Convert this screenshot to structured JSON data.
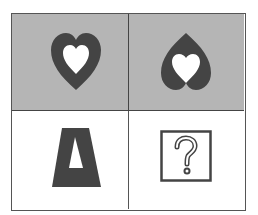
{
  "puzzle": {
    "cells": [
      {
        "position": "top-left",
        "shape": "heart",
        "orientation": "upright",
        "inner": "white-heart-upright",
        "background": "#b5b5b5"
      },
      {
        "position": "top-right",
        "shape": "heart",
        "orientation": "inverted",
        "inner": "white-heart-upright",
        "background": "#b5b5b5"
      },
      {
        "position": "bottom-left",
        "shape": "trapezoid",
        "orientation": "upright",
        "inner": "white-triangle",
        "background": "#ffffff"
      },
      {
        "position": "bottom-right",
        "shape": "question-box",
        "label": "?",
        "background": "#ffffff"
      }
    ],
    "colors": {
      "shape_fill": "#444444",
      "cell_shade": "#b5b5b5"
    }
  }
}
